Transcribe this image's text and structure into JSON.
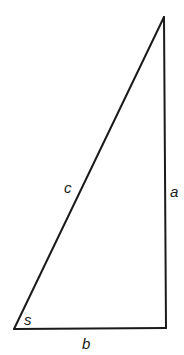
{
  "diagram": {
    "type": "right-triangle",
    "stroke_color": "#1a1a1a",
    "background": "#ffffff",
    "vertices": {
      "top": [
        164,
        17
      ],
      "bottom_left": [
        14,
        329
      ],
      "bottom_right": [
        166,
        328
      ]
    },
    "labels": {
      "hypotenuse": "c",
      "vertical_side": "a",
      "base": "b",
      "angle": "s"
    }
  }
}
